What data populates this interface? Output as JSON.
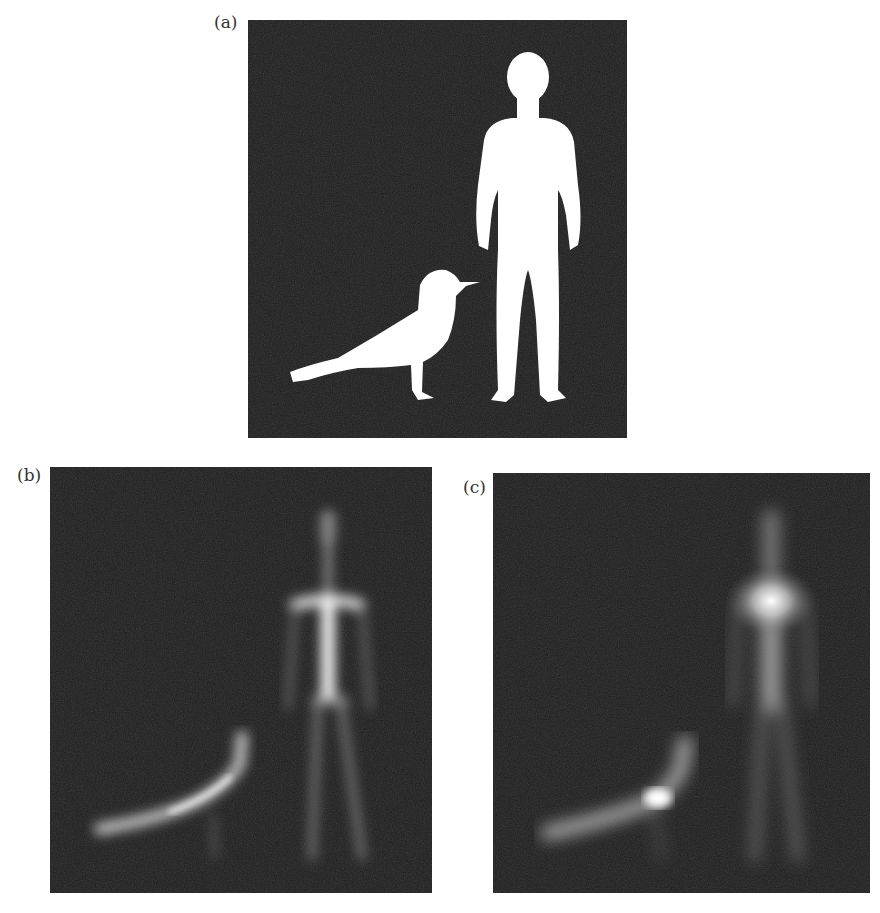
{
  "figure": {
    "panels": [
      {
        "id": "a",
        "label": "(a)",
        "description": "Binary silhouette of a bird (seagull) and a standing human on dark background"
      },
      {
        "id": "b",
        "label": "(b)",
        "description": "Blurred medial-axis / distance-transform style response of bird and human shapes"
      },
      {
        "id": "c",
        "label": "(c)",
        "description": "Alternative blurred skeleton response with bright center on human torso and bird body"
      }
    ],
    "colors": {
      "background": "#1c1c1c",
      "foreground": "#ffffff",
      "page": "#ffffff"
    }
  }
}
